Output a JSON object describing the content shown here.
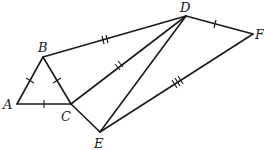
{
  "diagram": {
    "type": "geometry",
    "points": [
      {
        "name": "A",
        "x": 17,
        "y": 104
      },
      {
        "name": "B",
        "x": 43,
        "y": 57
      },
      {
        "name": "C",
        "x": 71,
        "y": 104
      },
      {
        "name": "D",
        "x": 186,
        "y": 16
      },
      {
        "name": "E",
        "x": 100,
        "y": 132
      },
      {
        "name": "F",
        "x": 253,
        "y": 34
      }
    ],
    "labels": {
      "A": "A",
      "B": "B",
      "C": "C",
      "D": "D",
      "E": "E",
      "F": "F"
    },
    "segments": [
      {
        "from": "A",
        "to": "B",
        "ticks": 1
      },
      {
        "from": "B",
        "to": "C",
        "ticks": 1
      },
      {
        "from": "A",
        "to": "C",
        "ticks": 1
      },
      {
        "from": "B",
        "to": "D",
        "ticks": 2
      },
      {
        "from": "C",
        "to": "D",
        "ticks": 2
      },
      {
        "from": "C",
        "to": "E",
        "ticks": 0
      },
      {
        "from": "D",
        "to": "E",
        "ticks": 0
      },
      {
        "from": "D",
        "to": "F",
        "ticks": 1
      },
      {
        "from": "E",
        "to": "F",
        "ticks": 3
      }
    ],
    "color": "#1a1a1a"
  }
}
